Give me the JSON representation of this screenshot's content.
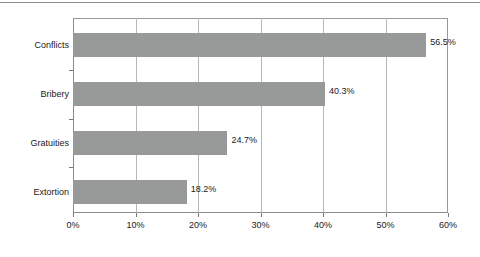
{
  "chart_data": {
    "type": "bar",
    "orientation": "horizontal",
    "title": "",
    "subtitle": "",
    "xlabel": "",
    "ylabel": "",
    "categories": [
      "Conflicts",
      "Bribery",
      "Gratuities",
      "Extortion"
    ],
    "values": [
      56.5,
      40.3,
      24.7,
      18.2
    ],
    "data_labels": [
      "56.5%",
      "40.3%",
      "24.7%",
      "18.2%"
    ],
    "xlim": [
      0,
      60
    ],
    "xticks": [
      0,
      10,
      20,
      30,
      40,
      50,
      60
    ],
    "xtick_labels": [
      "0%",
      "10%",
      "20%",
      "30%",
      "40%",
      "50%",
      "60%"
    ],
    "grid": "vertical",
    "legend": "none",
    "bar_color": "#989999",
    "gridline_color": "#b8b8b8",
    "axis_color": "#8a8a8a",
    "text_color": "#1a1a1a",
    "background_color": "#ffffff"
  },
  "figure": {
    "top_rule_color": "#8e8e8e"
  }
}
